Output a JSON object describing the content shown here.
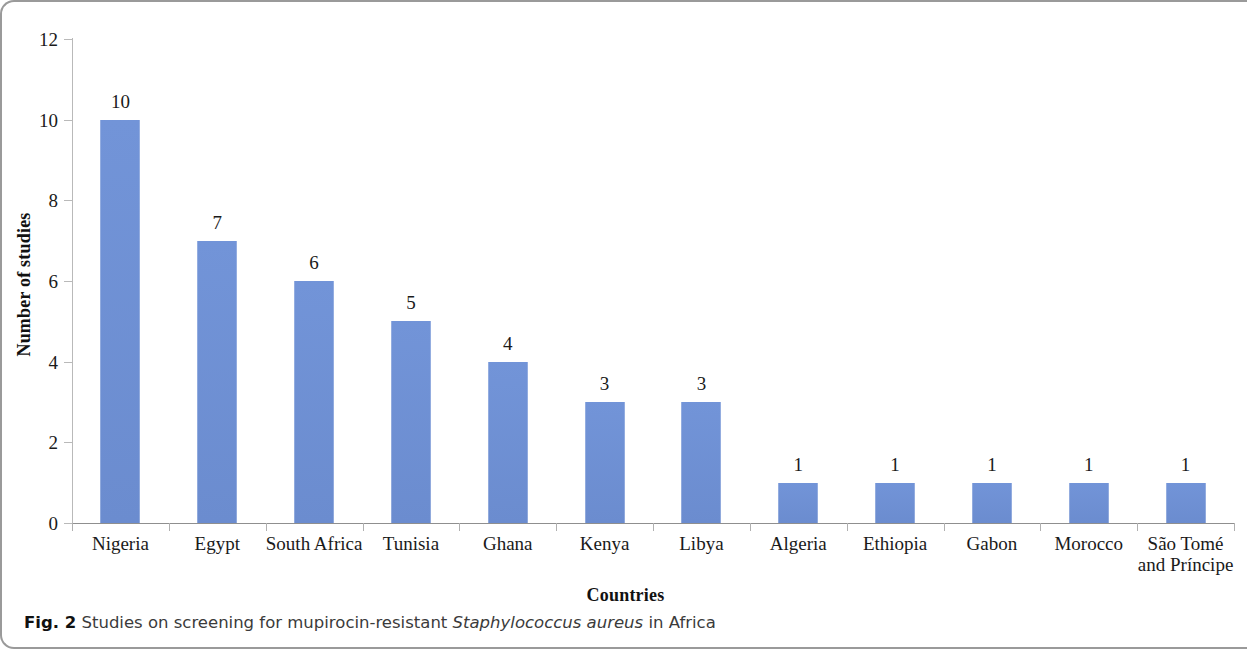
{
  "figure": {
    "caption_label": "Fig. 2",
    "caption_text_before": "Studies on screening for mupirocin-resistant",
    "caption_italic": "Staphylococcus aureus",
    "caption_text_after": "in Africa"
  },
  "chart_data": {
    "type": "bar",
    "title": "",
    "xlabel": "Countries",
    "ylabel": "Number of studies",
    "categories": [
      "Nigeria",
      "Egypt",
      "South Africa",
      "Tunisia",
      "Ghana",
      "Kenya",
      "Libya",
      "Algeria",
      "Ethiopia",
      "Gabon",
      "Morocco",
      "São Tomé\nand Príncipe"
    ],
    "values": [
      10,
      7,
      6,
      5,
      4,
      3,
      3,
      1,
      1,
      1,
      1,
      1
    ],
    "data_labels": [
      "10",
      "7",
      "6",
      "5",
      "4",
      "3",
      "3",
      "1",
      "1",
      "1",
      "1",
      "1"
    ],
    "ylim": [
      0,
      12
    ],
    "ytick_labels": [
      "12",
      "10",
      "8",
      "6",
      "4",
      "2",
      "0"
    ],
    "ytick_values": [
      12,
      10,
      8,
      6,
      4,
      2,
      0
    ],
    "grid": false,
    "legend": null,
    "bar_color": "#6e8fd4",
    "axis_color": "#b0b0b0"
  }
}
